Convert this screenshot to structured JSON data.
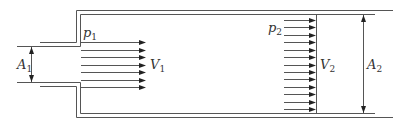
{
  "diagram": {
    "type": "sudden-expansion-pipe-flow",
    "labels": {
      "p1": {
        "sym": "p",
        "sub": "1"
      },
      "p2": {
        "sym": "p",
        "sub": "2"
      },
      "V1": {
        "sym": "V",
        "sub": "1"
      },
      "V2": {
        "sym": "V",
        "sub": "2"
      },
      "A1": {
        "sym": "A",
        "sub": "1"
      },
      "A2": {
        "sym": "A",
        "sub": "2"
      }
    },
    "arrows": {
      "inlet_count": 7,
      "outlet_count": 13
    },
    "colors": {
      "line": "#555555",
      "text": "#333333",
      "arrowhead": "#222222"
    }
  }
}
